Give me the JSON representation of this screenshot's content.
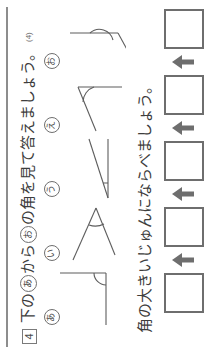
{
  "worksheet": {
    "question_number": "4",
    "question_sub_marker": "(4)",
    "headline": "下のあからおの角を見て答えましょう。",
    "headline_parts": {
      "before": "下の",
      "circle_a": "あ",
      "middle": "から",
      "circle_b": "お",
      "after": "の角を見て答えましょう。"
    },
    "subline": "角の大きいじゅんにならべましょう。"
  },
  "figures": [
    {
      "label": "あ",
      "name": "right-angle",
      "description": "直角",
      "approx_degrees": 90
    },
    {
      "label": "い",
      "name": "acute-angle",
      "description": "鋭角",
      "approx_degrees": 35
    },
    {
      "label": "う",
      "name": "narrow-angle",
      "description": "とても小さい角",
      "approx_degrees": 15
    },
    {
      "label": "え",
      "name": "obtuse-angle",
      "description": "鈍角",
      "approx_degrees": 120
    },
    {
      "label": "お",
      "name": "reflex-obtuse-angle",
      "description": "大きい鈍角",
      "approx_degrees": 135
    }
  ],
  "answer_row": {
    "box_count": 5,
    "arrow_count": 4,
    "boxes": [
      "",
      "",
      "",
      "",
      ""
    ],
    "arrow_glyph": "arrow-right"
  },
  "colors": {
    "ink": "#3d3d3d",
    "line": "#6e6e6e",
    "rule": "#8d8d8d",
    "paper": "#ffffff"
  }
}
